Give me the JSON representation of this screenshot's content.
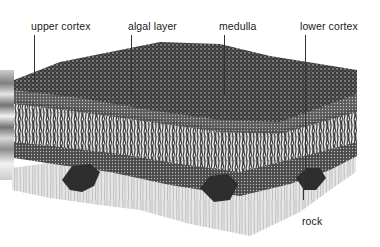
{
  "figure": {
    "labels": {
      "upper_cortex": "upper cortex",
      "algal_layer": "algal layer",
      "medulla": "medulla",
      "lower_cortex": "lower cortex",
      "rock": "rock"
    }
  }
}
